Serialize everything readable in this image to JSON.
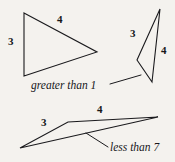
{
  "figure": {
    "background_color": "#f4f2ee",
    "stroke_color": "#1a1a1d",
    "text_color": "#17171a",
    "shapes": [
      {
        "name": "triangle-tall-left",
        "points": "24,13 97,52 24,76",
        "labels": [
          {
            "id": "t1-side3",
            "text": "3",
            "side": "left-vertical"
          },
          {
            "id": "t1-side4",
            "text": "4",
            "side": "top-slanted"
          }
        ]
      },
      {
        "name": "triangle-thin-right",
        "points": "160,9 152,82 137,60",
        "labels": [
          {
            "id": "t2-side3",
            "text": "3",
            "side": "upper-left"
          },
          {
            "id": "t2-side4",
            "text": "4",
            "side": "right"
          }
        ]
      },
      {
        "name": "triangle-flat-bottom",
        "points": "20,148 68,122 158,117",
        "labels": [
          {
            "id": "t3-side3",
            "text": "3",
            "side": "upper-left"
          },
          {
            "id": "t3-side4",
            "text": "4",
            "side": "top"
          }
        ]
      }
    ],
    "leader_lines": [
      {
        "name": "leader-greater-than-1",
        "x1": 110,
        "y1": 84,
        "x2": 141,
        "y2": 75
      },
      {
        "name": "leader-less-than-7",
        "x1": 108,
        "y1": 147,
        "x2": 86,
        "y2": 133
      }
    ],
    "annotations": [
      {
        "id": "note-greater",
        "text": "greater than 1"
      },
      {
        "id": "note-less",
        "text": "less than 7"
      }
    ],
    "numeric_labels": {
      "t1_side3": "3",
      "t1_side4": "4",
      "t2_side3": "3",
      "t2_side4": "4",
      "t3_side3": "3",
      "t3_side4": "4"
    },
    "annotation_text": {
      "greater": "greater than 1",
      "less": "less than 7"
    }
  }
}
